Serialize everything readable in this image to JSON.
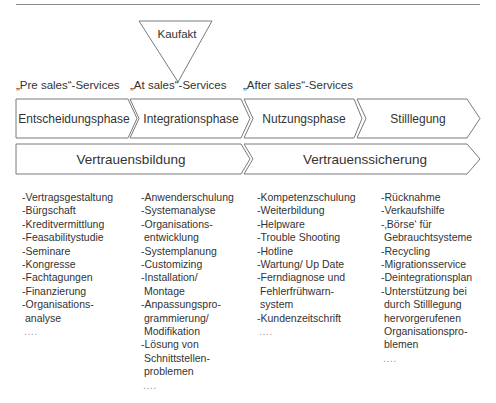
{
  "top_marker": {
    "label": "Kaufakt"
  },
  "services": [
    {
      "label": "„Pre sales“-Services"
    },
    {
      "label": "„At sales“-Services"
    },
    {
      "label": "„After sales“-Services"
    }
  ],
  "phases": [
    {
      "label": "Entscheidungsphase"
    },
    {
      "label": "Integrationsphase"
    },
    {
      "label": "Nutzungsphase"
    },
    {
      "label": "Stilllegung"
    }
  ],
  "trust": [
    {
      "label": "Vertrauensbildung"
    },
    {
      "label": "Vertrauenssicherung"
    }
  ],
  "lists": [
    {
      "lines": [
        "-Vertragsgestaltung",
        "-Bürgschaft",
        "-Kreditvermittlung",
        "-Feasabilitystudie",
        "-Seminare",
        "-Kongresse",
        "-Fachtagungen",
        "-Finanzierung",
        "-Organisations-",
        "analyse",
        "...."
      ]
    },
    {
      "lines": [
        "-Anwenderschulung",
        "-Systemanalyse",
        "-Organisations-",
        "entwicklung",
        "-Systemplanung",
        "-Customizing",
        "-Installation/",
        "Montage",
        "-Anpassungspro-",
        "grammierung/",
        "Modifikation",
        "-Lösung von",
        "Schnittstellen-",
        "problemen",
        "...."
      ]
    },
    {
      "lines": [
        "-Kompetenzschulung",
        "-Weiterbildung",
        "-Helpware",
        "-Trouble Shooting",
        "-Hotline",
        "-Wartung/ Up Date",
        "-Ferndiagnose und",
        "Fehlerfrühwarn-",
        "system",
        "-Kundenzeitschrift",
        "...."
      ]
    },
    {
      "lines": [
        "-Rücknahme",
        "-Verkaufshilfe",
        "-‚Börse‘ für",
        "Gebrauchtsysteme",
        "-Recycling",
        "-Migrationsservice",
        "-Deintegrationsplan",
        "-Unterstützung bei",
        "durch Stilllegung",
        "hervorgerufenen",
        "Organisationspro-",
        "blemen",
        "...."
      ]
    }
  ],
  "colors": {
    "stroke": "#7a7a7a",
    "text": "#333333",
    "background": "#ffffff"
  }
}
